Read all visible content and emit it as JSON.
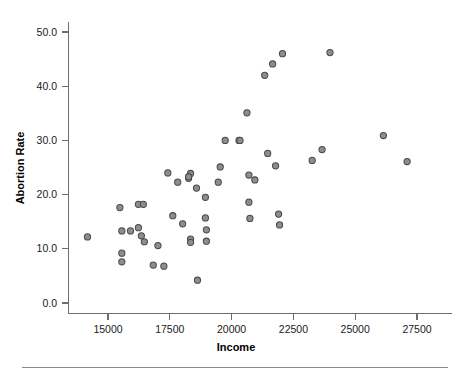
{
  "chart_data": {
    "type": "scatter",
    "title": "",
    "xlabel": "Income",
    "ylabel": "Abortion Rate",
    "xlim": [
      13200,
      28400
    ],
    "ylim": [
      -1.8,
      52.0
    ],
    "grid": false,
    "legend": false,
    "x_ticks": [
      15000,
      17500,
      20000,
      22500,
      25000,
      27500
    ],
    "x_tick_labels": [
      "15000",
      "17500",
      "20000",
      "22500",
      "25000",
      "27500"
    ],
    "y_ticks": [
      0.0,
      10.0,
      20.0,
      30.0,
      40.0,
      50.0
    ],
    "y_tick_labels": [
      "0.0",
      "10.0",
      "20.0",
      "30.0",
      "40.0",
      "50.0"
    ],
    "marker": {
      "shape": "circle",
      "fill_color": "#8d8d8d",
      "edge_color": "#4a4a4a",
      "radius_px": 3.1
    },
    "point_count": 51,
    "points": [
      {
        "x": 14170,
        "y": 12.2
      },
      {
        "x": 15480,
        "y": 17.6
      },
      {
        "x": 15560,
        "y": 13.3
      },
      {
        "x": 15560,
        "y": 9.2
      },
      {
        "x": 15560,
        "y": 7.6
      },
      {
        "x": 15910,
        "y": 13.3
      },
      {
        "x": 16230,
        "y": 18.2
      },
      {
        "x": 16230,
        "y": 13.9
      },
      {
        "x": 16350,
        "y": 12.4
      },
      {
        "x": 16430,
        "y": 18.2
      },
      {
        "x": 16470,
        "y": 11.3
      },
      {
        "x": 16830,
        "y": 7.0
      },
      {
        "x": 17020,
        "y": 10.6
      },
      {
        "x": 17260,
        "y": 6.8
      },
      {
        "x": 17420,
        "y": 24.0
      },
      {
        "x": 17620,
        "y": 16.1
      },
      {
        "x": 17820,
        "y": 22.3
      },
      {
        "x": 18020,
        "y": 14.6
      },
      {
        "x": 18260,
        "y": 23.0
      },
      {
        "x": 18340,
        "y": 23.9
      },
      {
        "x": 18340,
        "y": 11.8
      },
      {
        "x": 18340,
        "y": 11.2
      },
      {
        "x": 18580,
        "y": 21.2
      },
      {
        "x": 18620,
        "y": 4.2
      },
      {
        "x": 18940,
        "y": 19.5
      },
      {
        "x": 18940,
        "y": 15.7
      },
      {
        "x": 18980,
        "y": 13.5
      },
      {
        "x": 18980,
        "y": 11.4
      },
      {
        "x": 19460,
        "y": 22.3
      },
      {
        "x": 19540,
        "y": 25.1
      },
      {
        "x": 19740,
        "y": 30.0
      },
      {
        "x": 20300,
        "y": 30.0
      },
      {
        "x": 20620,
        "y": 35.1
      },
      {
        "x": 20700,
        "y": 23.6
      },
      {
        "x": 20700,
        "y": 18.6
      },
      {
        "x": 20740,
        "y": 15.6
      },
      {
        "x": 20940,
        "y": 22.7
      },
      {
        "x": 21340,
        "y": 42.0
      },
      {
        "x": 21460,
        "y": 27.6
      },
      {
        "x": 21660,
        "y": 44.1
      },
      {
        "x": 21780,
        "y": 25.3
      },
      {
        "x": 21900,
        "y": 16.4
      },
      {
        "x": 21940,
        "y": 14.4
      },
      {
        "x": 22060,
        "y": 46.0
      },
      {
        "x": 23260,
        "y": 26.3
      },
      {
        "x": 23660,
        "y": 28.3
      },
      {
        "x": 23980,
        "y": 46.2
      },
      {
        "x": 26140,
        "y": 30.9
      },
      {
        "x": 27100,
        "y": 26.1
      },
      {
        "x": 20340,
        "y": 30.0
      },
      {
        "x": 18260,
        "y": 23.3
      }
    ]
  },
  "figure": {
    "background_color": "#ffffff",
    "axis_color": "#6e6e6e",
    "text_color": "#1a1a1a",
    "footer_rule_color": "#8a8a8a"
  }
}
